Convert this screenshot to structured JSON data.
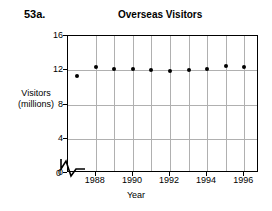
{
  "problem_label": "53a.",
  "axis_origin_label": "0",
  "chart_data": {
    "type": "scatter",
    "title": "Overseas Visitors",
    "xlabel": "Year",
    "ylabel": "Visitors\n(millions)",
    "ylabel_line1": "Visitors",
    "ylabel_line2": "(millions)",
    "grid": true,
    "legend": "none",
    "xlim": [
      1986.5,
      1996.8
    ],
    "ylim": [
      0,
      16
    ],
    "yticks": [
      0,
      4,
      8,
      12,
      16
    ],
    "ytick_labels": [
      "0",
      "4",
      "8",
      "12",
      "16"
    ],
    "xticks": [
      1988,
      1990,
      1992,
      1994,
      1996
    ],
    "xtick_labels": [
      "1988",
      "1990",
      "1992",
      "1994",
      "1996"
    ],
    "x_gridlines": [
      1988,
      1989,
      1990,
      1991,
      1992,
      1993,
      1994,
      1995,
      1996
    ],
    "axis_break": true,
    "marker": "filled-circle",
    "marker_color": "#000000",
    "x": [
      1987,
      1988,
      1989,
      1990,
      1991,
      1992,
      1993,
      1994,
      1995,
      1996
    ],
    "values": [
      11.3,
      12.4,
      12.1,
      12.1,
      12.0,
      11.9,
      12.0,
      12.2,
      12.5,
      12.4
    ],
    "points": [
      {
        "year": 1987,
        "visitors": 11.3
      },
      {
        "year": 1988,
        "visitors": 12.4
      },
      {
        "year": 1989,
        "visitors": 12.1
      },
      {
        "year": 1990,
        "visitors": 12.1
      },
      {
        "year": 1991,
        "visitors": 12.0
      },
      {
        "year": 1992,
        "visitors": 11.9
      },
      {
        "year": 1993,
        "visitors": 12.0
      },
      {
        "year": 1994,
        "visitors": 12.2
      },
      {
        "year": 1995,
        "visitors": 12.5
      },
      {
        "year": 1996,
        "visitors": 12.4
      }
    ]
  }
}
